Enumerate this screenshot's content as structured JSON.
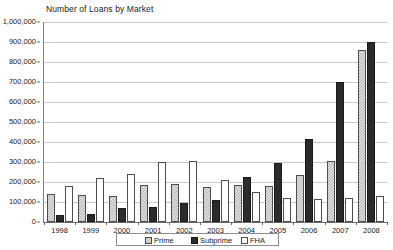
{
  "chart_data": {
    "type": "bar",
    "title": "Number of Loans by Market",
    "xlabel": "",
    "ylabel": "",
    "categories": [
      "1998",
      "1999",
      "2000",
      "2001",
      "2002",
      "2003",
      "2004",
      "2005",
      "2006",
      "2007",
      "2008"
    ],
    "series": [
      {
        "name": "Prime",
        "color": "#b3b3b3",
        "values": [
          140000,
          135000,
          132000,
          185000,
          192000,
          175000,
          185000,
          180000,
          235000,
          305000,
          860000
        ]
      },
      {
        "name": "Subprime",
        "color": "#2b2b2b",
        "values": [
          35000,
          40000,
          68000,
          75000,
          95000,
          110000,
          225000,
          295000,
          415000,
          700000,
          900000
        ]
      },
      {
        "name": "FHA",
        "color": "#ffffff",
        "values": [
          180000,
          220000,
          240000,
          300000,
          305000,
          210000,
          150000,
          120000,
          115000,
          120000,
          130000
        ]
      }
    ],
    "ylim": [
      0,
      1000000
    ],
    "ytick_values": [
      0,
      100000,
      200000,
      300000,
      400000,
      500000,
      600000,
      700000,
      800000,
      900000,
      1000000
    ],
    "ytick_labels": [
      "0",
      "100,000",
      "200,000",
      "300,000",
      "400,000",
      "500,000",
      "600,000",
      "700,000",
      "800,000",
      "900,000",
      "1,000,000"
    ],
    "grid": true,
    "grid_axis": "y",
    "legend_position": "bottom"
  },
  "legend": {
    "items": [
      {
        "label": "Prime",
        "icon": "swatch-prime-icon"
      },
      {
        "label": "Subprime",
        "icon": "swatch-subprime-icon"
      },
      {
        "label": "FHA",
        "icon": "swatch-fha-icon"
      }
    ]
  }
}
